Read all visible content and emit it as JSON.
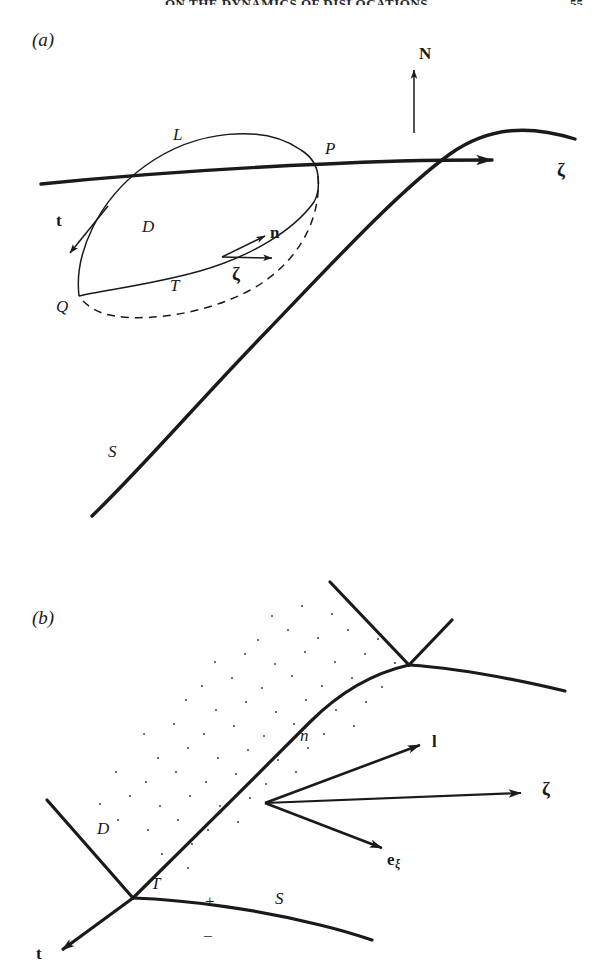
{
  "header": {
    "running_title": "ON THE DYNAMICS OF DISLOCATIONS",
    "page_number": "55"
  },
  "figure": {
    "panels": [
      {
        "id": "a",
        "label": "(a)",
        "description": "Dislocation loop D bounded by curve, on surface S, with normal N and tangent vectors",
        "labels": [
          {
            "name": "panel-label",
            "text": "(a)",
            "style": "italic",
            "x": 32,
            "y": 30
          },
          {
            "name": "normal-vector-N",
            "text": "N",
            "style": "bold",
            "x": 419,
            "y": 45
          },
          {
            "name": "curve-L",
            "text": "L",
            "style": "italic",
            "x": 173,
            "y": 126
          },
          {
            "name": "point-P",
            "text": "P",
            "style": "italic",
            "x": 325,
            "y": 140
          },
          {
            "name": "zeta-axis",
            "text": "ζ",
            "style": "bold",
            "x": 557,
            "y": 160
          },
          {
            "name": "tangent-vector-t",
            "text": "t",
            "style": "bold",
            "x": 56,
            "y": 212
          },
          {
            "name": "region-D",
            "text": "D",
            "style": "italic",
            "x": 142,
            "y": 218
          },
          {
            "name": "normal-vector-n",
            "text": "n",
            "style": "bold",
            "x": 270,
            "y": 224
          },
          {
            "name": "zeta-vector",
            "text": "ζ",
            "style": "bold",
            "x": 232,
            "y": 264
          },
          {
            "name": "curve-T",
            "text": "T",
            "style": "italic",
            "x": 170,
            "y": 277
          },
          {
            "name": "point-Q",
            "text": "Q",
            "style": "italic",
            "x": 56,
            "y": 298
          },
          {
            "name": "surface-S",
            "text": "S",
            "style": "italic",
            "x": 108,
            "y": 443
          }
        ]
      },
      {
        "id": "b",
        "label": "(b)",
        "description": "Stippled region D with boundary T, line l, surface S with plus and minus sides, vectors n, zeta, e-xi and t",
        "labels": [
          {
            "name": "panel-label",
            "text": "(b)",
            "style": "italic",
            "x": 32,
            "y": 608
          },
          {
            "name": "normal-vector-n",
            "text": "n",
            "style": "bold",
            "x": 432,
            "y": 733
          },
          {
            "name": "line-l",
            "text": "l",
            "style": "italic",
            "x": 300,
            "y": 727
          },
          {
            "name": "zeta-vector",
            "text": "ζ",
            "style": "bold",
            "x": 542,
            "y": 779
          },
          {
            "name": "region-D",
            "text": "D",
            "style": "italic",
            "x": 97,
            "y": 820
          },
          {
            "name": "e-xi-vector",
            "text": "e",
            "subscript": "ξ",
            "style": "bold",
            "x": 387,
            "y": 851
          },
          {
            "name": "curve-T",
            "text": "T",
            "style": "italic",
            "x": 151,
            "y": 875
          },
          {
            "name": "plus-sign",
            "text": "+",
            "style": "roman",
            "x": 205,
            "y": 893
          },
          {
            "name": "surface-S",
            "text": "S",
            "style": "italic",
            "x": 275,
            "y": 890
          },
          {
            "name": "minus-sign",
            "text": "−",
            "style": "roman",
            "x": 203,
            "y": 928
          },
          {
            "name": "tangent-vector-t",
            "text": "t",
            "style": "bold",
            "x": 36,
            "y": 945
          }
        ]
      }
    ],
    "colors": {
      "ink": "#1a1a1a",
      "stipple": "#4a4a4a",
      "background": "#ffffff"
    }
  }
}
